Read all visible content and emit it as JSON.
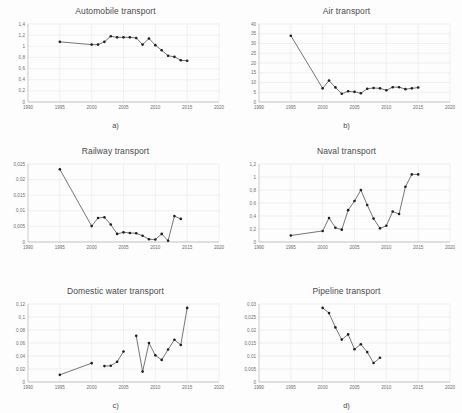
{
  "figure": {
    "background": "#fdfdfd",
    "line_color": "#2b2b2b",
    "marker_color": "#1f1f1f",
    "grid_color": "#e2e2e2",
    "axis_color": "#9a9a9a"
  },
  "panels": [
    {
      "caption": "a)",
      "title": "Automobile transport",
      "xticks": [
        "1990",
        "1995",
        "2000",
        "2005",
        "2010",
        "2015",
        "2020"
      ],
      "yticks": [
        "1,4",
        "1,2",
        "1",
        "0,8",
        "0,6",
        "0,4",
        "0,2",
        "0"
      ]
    },
    {
      "caption": "b)",
      "title": "Air transport",
      "xticks": [
        "1990",
        "1995",
        "2000",
        "2005",
        "2010",
        "2015",
        "2020"
      ],
      "yticks": [
        "40",
        "35",
        "30",
        "25",
        "20",
        "15",
        "10",
        "5",
        "0"
      ]
    },
    {
      "caption": "c)",
      "title": "Railway transport",
      "xticks": [
        "1990",
        "1995",
        "2000",
        "2005",
        "2010",
        "2015",
        "2020"
      ],
      "yticks": [
        "0,025",
        "0,02",
        "0,015",
        "0,01",
        "0,005",
        "0"
      ]
    },
    {
      "caption": "d)",
      "title": "Naval transport",
      "xticks": [
        "1990",
        "1995",
        "2000",
        "2005",
        "2010",
        "2015",
        "2020"
      ],
      "yticks": [
        "1,2",
        "1",
        "0,8",
        "0,6",
        "0,4",
        "0,2",
        "0"
      ]
    },
    {
      "caption": "e)",
      "title": "Domestic water transport",
      "xticks": [
        "1990",
        "1995",
        "2000",
        "2005",
        "2010",
        "2015",
        "2020"
      ],
      "yticks": [
        "0,12",
        "0,1",
        "0,08",
        "0,06",
        "0,04",
        "0,02",
        "0"
      ]
    },
    {
      "caption": "f)",
      "title": "Pipeline transport",
      "xticks": [
        "1990",
        "1995",
        "2000",
        "2005",
        "2010",
        "2015",
        "2020"
      ],
      "yticks": [
        "0,03",
        "0,025",
        "0,02",
        "0,015",
        "0,01",
        "0,005",
        "0"
      ]
    }
  ],
  "chart_data": [
    {
      "type": "line",
      "id": "a",
      "title": "Automobile transport",
      "xlabel": "",
      "ylabel": "",
      "xlim": [
        1990,
        2020
      ],
      "ylim": [
        0,
        1.4
      ],
      "ytick_values": [
        0,
        0.2,
        0.4,
        0.6,
        0.8,
        1.0,
        1.2,
        1.4
      ],
      "xtick_values": [
        1990,
        1995,
        2000,
        2005,
        2010,
        2015,
        2020
      ],
      "grid": true,
      "legend": "none",
      "x": [
        1995,
        2000,
        2001,
        2002,
        2003,
        2004,
        2005,
        2006,
        2007,
        2008,
        2009,
        2010,
        2011,
        2012,
        2013,
        2014,
        2015
      ],
      "y": [
        1.08,
        1.03,
        1.03,
        1.08,
        1.18,
        1.16,
        1.16,
        1.16,
        1.15,
        1.03,
        1.14,
        1.02,
        0.93,
        0.83,
        0.81,
        0.75,
        0.74
      ]
    },
    {
      "type": "line",
      "id": "b",
      "title": "Air transport",
      "xlabel": "",
      "ylabel": "",
      "xlim": [
        1990,
        2020
      ],
      "ylim": [
        0,
        40
      ],
      "ytick_values": [
        0,
        5,
        10,
        15,
        20,
        25,
        30,
        35,
        40
      ],
      "xtick_values": [
        1990,
        1995,
        2000,
        2005,
        2010,
        2015,
        2020
      ],
      "grid": true,
      "legend": "none",
      "x": [
        1995,
        2000,
        2001,
        2002,
        2003,
        2004,
        2005,
        2006,
        2007,
        2008,
        2009,
        2010,
        2011,
        2012,
        2013,
        2014,
        2015
      ],
      "y": [
        34,
        7,
        11,
        7.5,
        4.2,
        5.5,
        5.2,
        4.5,
        6.8,
        7.2,
        7.0,
        6.0,
        7.6,
        7.6,
        6.6,
        7.0,
        7.4
      ]
    },
    {
      "type": "line",
      "id": "c",
      "title": "Railway transport",
      "xlabel": "",
      "ylabel": "",
      "xlim": [
        1990,
        2020
      ],
      "ylim": [
        0,
        0.025
      ],
      "ytick_values": [
        0,
        0.005,
        0.01,
        0.015,
        0.02,
        0.025
      ],
      "xtick_values": [
        1990,
        1995,
        2000,
        2005,
        2010,
        2015,
        2020
      ],
      "grid": true,
      "legend": "none",
      "x": [
        1995,
        2000,
        2001,
        2002,
        2003,
        2004,
        2005,
        2006,
        2007,
        2008,
        2009,
        2010,
        2011,
        2012,
        2013,
        2014
      ],
      "y": [
        0.0233,
        0.0051,
        0.0077,
        0.0079,
        0.0056,
        0.0026,
        0.0031,
        0.0029,
        0.0028,
        0.002,
        0.0009,
        0.0008,
        0.0026,
        0.0004,
        0.0083,
        0.0074
      ]
    },
    {
      "type": "line",
      "id": "d",
      "title": "Naval transport",
      "xlabel": "",
      "ylabel": "",
      "xlim": [
        1990,
        2020
      ],
      "ylim": [
        0,
        1.2
      ],
      "ytick_values": [
        0,
        0.2,
        0.4,
        0.6,
        0.8,
        1.0,
        1.2
      ],
      "xtick_values": [
        1990,
        1995,
        2000,
        2005,
        2010,
        2015,
        2020
      ],
      "grid": true,
      "legend": "none",
      "x": [
        1995,
        2000,
        2001,
        2002,
        2003,
        2004,
        2005,
        2006,
        2007,
        2008,
        2009,
        2010,
        2011,
        2012,
        2013,
        2014,
        2015
      ],
      "y": [
        0.1,
        0.17,
        0.37,
        0.22,
        0.19,
        0.49,
        0.63,
        0.8,
        0.57,
        0.36,
        0.21,
        0.25,
        0.47,
        0.43,
        0.85,
        1.04,
        1.04
      ]
    },
    {
      "type": "line",
      "id": "e",
      "title": "Domestic water transport",
      "xlabel": "",
      "ylabel": "",
      "xlim": [
        1990,
        2020
      ],
      "ylim": [
        0,
        0.12
      ],
      "ytick_values": [
        0,
        0.02,
        0.04,
        0.06,
        0.08,
        0.1,
        0.12
      ],
      "xtick_values": [
        1990,
        1995,
        2000,
        2005,
        2010,
        2015,
        2020
      ],
      "grid": true,
      "legend": "none",
      "segments": [
        {
          "x": [
            1995,
            2000
          ],
          "y": [
            0.011,
            0.029
          ]
        },
        {
          "x": [
            2002,
            2003,
            2004,
            2005
          ],
          "y": [
            0.0245,
            0.025,
            0.031,
            0.047
          ]
        },
        {
          "x": [
            2007,
            2008,
            2009,
            2010,
            2011,
            2012,
            2013,
            2014,
            2015
          ],
          "y": [
            0.071,
            0.016,
            0.06,
            0.041,
            0.034,
            0.05,
            0.065,
            0.057,
            0.114
          ]
        }
      ]
    },
    {
      "type": "line",
      "id": "f",
      "title": "Pipeline transport",
      "xlabel": "",
      "ylabel": "",
      "xlim": [
        1990,
        2020
      ],
      "ylim": [
        0,
        0.03
      ],
      "ytick_values": [
        0,
        0.005,
        0.01,
        0.015,
        0.02,
        0.025,
        0.03
      ],
      "xtick_values": [
        1990,
        1995,
        2000,
        2005,
        2010,
        2015,
        2020
      ],
      "grid": true,
      "legend": "none",
      "x": [
        2000,
        2001,
        2002,
        2003,
        2004,
        2005,
        2006,
        2007,
        2008,
        2009
      ],
      "y": [
        0.0285,
        0.0265,
        0.021,
        0.0163,
        0.0183,
        0.0126,
        0.0145,
        0.0115,
        0.0073,
        0.0093
      ]
    }
  ]
}
